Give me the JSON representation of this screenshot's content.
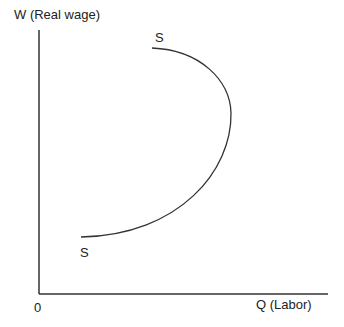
{
  "diagram": {
    "y_axis_label": "W (Real wage)",
    "x_axis_label": "Q (Labor)",
    "origin_label": "0",
    "curve_label_top": "S",
    "curve_label_bottom": "S",
    "colors": {
      "line": "#333333",
      "text": "#222222",
      "background": "#ffffff"
    }
  }
}
